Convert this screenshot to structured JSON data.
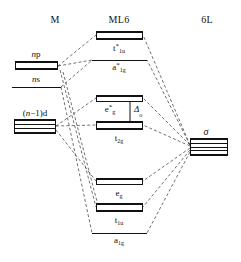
{
  "figure": {
    "type": "molecular-orbital-energy-level-diagram"
  },
  "columns": {
    "left": {
      "label": "M",
      "x": 55,
      "y": 14
    },
    "center": {
      "label": "ML6",
      "x": 119,
      "y": 14
    },
    "right": {
      "label": "6L",
      "x": 207,
      "y": 14
    }
  },
  "metal_levels": [
    {
      "id": "np",
      "label": "np",
      "label_html": "<i>n</i>p",
      "degeneracy": 3,
      "style": "box",
      "x": 15,
      "y": 61,
      "w": 43,
      "h": 9,
      "label_x": 36,
      "label_y": 49
    },
    {
      "id": "ns",
      "label": "ns",
      "label_html": "<i>n</i>s",
      "degeneracy": 1,
      "style": "line",
      "x": 12,
      "y": 87,
      "w": 49,
      "label_x": 36,
      "label_y": 74
    },
    {
      "id": "n-1-d",
      "label": "(n−1)d",
      "label_html": "(<i>n</i>−1)d",
      "degeneracy": 5,
      "style": "box",
      "x": 14,
      "y": 119,
      "w": 42,
      "h": 15,
      "label_x": 35,
      "label_y": 108
    }
  ],
  "mo_levels": [
    {
      "id": "t1u-star",
      "label": "t*1u",
      "base": "t",
      "star": "*",
      "sub": "1u",
      "degeneracy": 3,
      "style": "box",
      "character": "antibonding",
      "x": 96,
      "y": 31,
      "w": 47,
      "h": 9,
      "label_x": 119,
      "label_y": 43
    },
    {
      "id": "a1g-star",
      "label": "a*1g",
      "base": "a",
      "star": "*",
      "sub": "1g",
      "degeneracy": 1,
      "style": "line",
      "character": "antibonding",
      "x": 92,
      "y": 60,
      "w": 55,
      "label_x": 119,
      "label_y": 62
    },
    {
      "id": "eg-star",
      "label": "e*g",
      "base": "e",
      "star": "*",
      "sub": "g",
      "degeneracy": 2,
      "style": "box",
      "character": "antibonding",
      "x": 96,
      "y": 95,
      "w": 47,
      "h": 7,
      "label_x": 110,
      "label_y": 104
    },
    {
      "id": "t2g",
      "label": "t2g",
      "base": "t",
      "star": "",
      "sub": "2g",
      "degeneracy": 3,
      "style": "box",
      "character": "nonbonding",
      "x": 96,
      "y": 121,
      "w": 47,
      "h": 9,
      "label_x": 119,
      "label_y": 133
    },
    {
      "id": "eg",
      "label": "eg",
      "base": "e",
      "star": "",
      "sub": "g",
      "degeneracy": 2,
      "style": "box",
      "character": "bonding",
      "x": 96,
      "y": 178,
      "w": 47,
      "h": 7,
      "label_x": 119,
      "label_y": 188
    },
    {
      "id": "t1u",
      "label": "t1u",
      "base": "t",
      "star": "",
      "sub": "1u",
      "degeneracy": 3,
      "style": "box",
      "character": "bonding",
      "x": 96,
      "y": 203,
      "w": 47,
      "h": 9,
      "label_x": 119,
      "label_y": 215
    },
    {
      "id": "a1g",
      "label": "a1g",
      "base": "a",
      "star": "",
      "sub": "1g",
      "degeneracy": 1,
      "style": "line",
      "character": "bonding",
      "x": 92,
      "y": 233,
      "w": 55,
      "label_x": 119,
      "label_y": 235
    }
  ],
  "ligand_levels": [
    {
      "id": "sigma",
      "label": "σ",
      "degeneracy": 6,
      "style": "box",
      "x": 190,
      "y": 138,
      "w": 38,
      "h": 18,
      "label_x": 206,
      "label_y": 126
    }
  ],
  "annotations": [
    {
      "id": "delta-o",
      "label": "Δ",
      "sub": "o",
      "kind": "splitting-gap",
      "arrow_x": 130,
      "arrow_y1": 99,
      "arrow_y2": 123,
      "label_x": 134,
      "label_y": 104
    }
  ],
  "correlation_lines": [
    {
      "from": "np",
      "to": "t1u-star",
      "x1": 58,
      "y1": 66,
      "x2": 96,
      "y2": 35
    },
    {
      "from": "np",
      "to": "a1g-star",
      "x1": 58,
      "y1": 66,
      "x2": 92,
      "y2": 60
    },
    {
      "from": "ns",
      "to": "a1g-star",
      "x1": 61,
      "y1": 87,
      "x2": 92,
      "y2": 60
    },
    {
      "from": "ns",
      "to": "a1g",
      "x1": 61,
      "y1": 87,
      "x2": 92,
      "y2": 233
    },
    {
      "from": "np",
      "to": "t1u",
      "x1": 60,
      "y1": 70,
      "x2": 96,
      "y2": 207
    },
    {
      "from": "np",
      "to": "t1u",
      "x1": 63,
      "y1": 72,
      "x2": 99,
      "y2": 209
    },
    {
      "from": "n-1-d",
      "to": "eg-star",
      "x1": 56,
      "y1": 126,
      "x2": 96,
      "y2": 98
    },
    {
      "from": "n-1-d",
      "to": "t2g",
      "x1": 56,
      "y1": 126,
      "x2": 96,
      "y2": 125
    },
    {
      "from": "n-1-d",
      "to": "eg",
      "x1": 56,
      "y1": 130,
      "x2": 96,
      "y2": 181
    },
    {
      "from": "sigma",
      "to": "t1u-star",
      "x1": 190,
      "y1": 145,
      "x2": 143,
      "y2": 35
    },
    {
      "from": "sigma",
      "to": "a1g-star",
      "x1": 190,
      "y1": 145,
      "x2": 147,
      "y2": 60
    },
    {
      "from": "sigma",
      "to": "eg-star",
      "x1": 190,
      "y1": 145,
      "x2": 143,
      "y2": 98
    },
    {
      "from": "sigma",
      "to": "t2g",
      "x1": 190,
      "y1": 146,
      "x2": 143,
      "y2": 125
    },
    {
      "from": "sigma",
      "to": "eg",
      "x1": 190,
      "y1": 148,
      "x2": 143,
      "y2": 181
    },
    {
      "from": "sigma",
      "to": "t1u",
      "x1": 190,
      "y1": 150,
      "x2": 143,
      "y2": 207
    },
    {
      "from": "sigma",
      "to": "a1g",
      "x1": 190,
      "y1": 152,
      "x2": 147,
      "y2": 233
    }
  ],
  "colors": {
    "ink": "#111111",
    "background": "#ffffff",
    "wire": "#333333"
  }
}
